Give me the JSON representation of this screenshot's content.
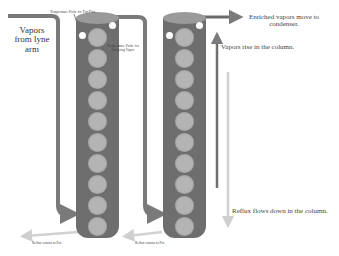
{
  "diagram": {
    "type": "distillation column (reflux) diagram",
    "left_column": {
      "inlet_label": "Vapors from lyne arm",
      "probe_top_label": "Temperature Probe for Top Plate",
      "probe_vapor_label": "Temperature Probe for Outgoing Vapor",
      "bottom_label": "Reflux returns to Pot",
      "plate_count": 10
    },
    "right_column": {
      "bottom_label": "Reflux returns to Pot",
      "plate_count": 10
    },
    "annotations": {
      "enriched": "Enriched vapors move to condenser.",
      "vapors_rise": "Vapors rise in the column.",
      "reflux_down": "Reflux flows down in the column."
    },
    "colors": {
      "column_body": "#6e6e6e",
      "column_top": "#9a9a9a",
      "plate": "#b4b4b4",
      "pipe": "#7a7a7a",
      "reflux_arrow": "#d8d8d8"
    }
  }
}
